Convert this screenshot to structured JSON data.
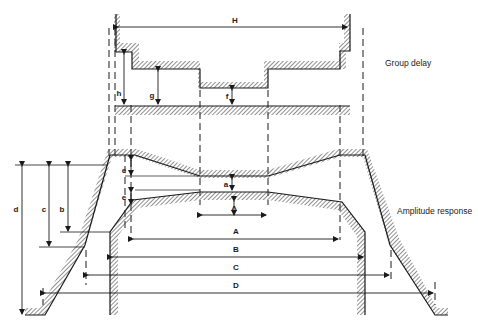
{
  "figure": {
    "labels": {
      "group_delay": "Group delay",
      "amplitude_response": "Amplitude response"
    },
    "dimensions": {
      "H": "H",
      "h": "h",
      "g": "g",
      "f": "f",
      "e_top": "e",
      "a": "a",
      "e_bottom": "e",
      "delta": "Δ",
      "A": "A",
      "B": "B",
      "C": "C",
      "D": "D",
      "b": "b",
      "c": "c",
      "d": "d"
    },
    "colors": {
      "line": "#1a1a1a",
      "hatch": "#555555",
      "background": "#ffffff"
    }
  }
}
